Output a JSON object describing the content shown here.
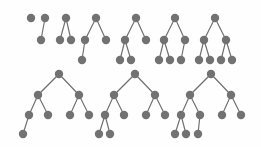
{
  "figure": {
    "title": "",
    "canvas": {
      "width": 261,
      "height": 147
    },
    "background_color": "#fefefe",
    "node_color": "#727272",
    "edge_color": "#6e6e6e",
    "node_radius": 4.2,
    "edge_width": 1.15,
    "rows": 2,
    "tree_count": 10
  },
  "trees": [
    {
      "id": "tree-1",
      "row": 1,
      "index": 1,
      "node_count": 1,
      "depth": 1,
      "nodes": [
        {
          "id": "t1-n1",
          "x": 31,
          "y": 18,
          "level": 0
        }
      ],
      "edges": []
    },
    {
      "id": "tree-2",
      "row": 1,
      "index": 2,
      "node_count": 2,
      "depth": 2,
      "nodes": [
        {
          "id": "t2-n1",
          "x": 45,
          "y": 18,
          "level": 0
        },
        {
          "id": "t2-n2",
          "x": 41,
          "y": 40,
          "level": 1
        }
      ],
      "edges": [
        {
          "from": "t2-n1",
          "to": "t2-n2"
        }
      ]
    },
    {
      "id": "tree-3",
      "row": 1,
      "index": 3,
      "node_count": 3,
      "depth": 2,
      "nodes": [
        {
          "id": "t3-n1",
          "x": 66,
          "y": 18,
          "level": 0
        },
        {
          "id": "t3-n2",
          "x": 60,
          "y": 40,
          "level": 1
        },
        {
          "id": "t3-n3",
          "x": 71,
          "y": 40,
          "level": 1
        }
      ],
      "edges": [
        {
          "from": "t3-n1",
          "to": "t3-n2"
        },
        {
          "from": "t3-n1",
          "to": "t3-n3"
        }
      ]
    },
    {
      "id": "tree-4",
      "row": 1,
      "index": 4,
      "node_count": 4,
      "depth": 3,
      "nodes": [
        {
          "id": "t4-n1",
          "x": 96,
          "y": 18,
          "level": 0
        },
        {
          "id": "t4-n2",
          "x": 85,
          "y": 40,
          "level": 1
        },
        {
          "id": "t4-n3",
          "x": 106,
          "y": 40,
          "level": 1
        },
        {
          "id": "t4-n4",
          "x": 82,
          "y": 60,
          "level": 2
        }
      ],
      "edges": [
        {
          "from": "t4-n1",
          "to": "t4-n2"
        },
        {
          "from": "t4-n1",
          "to": "t4-n3"
        },
        {
          "from": "t4-n2",
          "to": "t4-n4"
        }
      ]
    },
    {
      "id": "tree-5",
      "row": 1,
      "index": 5,
      "node_count": 5,
      "depth": 3,
      "nodes": [
        {
          "id": "t5-n1",
          "x": 136,
          "y": 18,
          "level": 0
        },
        {
          "id": "t5-n2",
          "x": 125,
          "y": 40,
          "level": 1
        },
        {
          "id": "t5-n3",
          "x": 146,
          "y": 40,
          "level": 1
        },
        {
          "id": "t5-n4",
          "x": 120,
          "y": 60,
          "level": 2
        },
        {
          "id": "t5-n5",
          "x": 131,
          "y": 60,
          "level": 2
        }
      ],
      "edges": [
        {
          "from": "t5-n1",
          "to": "t5-n2"
        },
        {
          "from": "t5-n1",
          "to": "t5-n3"
        },
        {
          "from": "t5-n2",
          "to": "t5-n4"
        },
        {
          "from": "t5-n2",
          "to": "t5-n5"
        }
      ]
    },
    {
      "id": "tree-6",
      "row": 1,
      "index": 6,
      "node_count": 6,
      "depth": 3,
      "nodes": [
        {
          "id": "t6-n1",
          "x": 175,
          "y": 18,
          "level": 0
        },
        {
          "id": "t6-n2",
          "x": 164,
          "y": 40,
          "level": 1
        },
        {
          "id": "t6-n3",
          "x": 185,
          "y": 40,
          "level": 1
        },
        {
          "id": "t6-n4",
          "x": 159,
          "y": 60,
          "level": 2
        },
        {
          "id": "t6-n5",
          "x": 170,
          "y": 60,
          "level": 2
        },
        {
          "id": "t6-n6",
          "x": 181,
          "y": 60,
          "level": 2
        }
      ],
      "edges": [
        {
          "from": "t6-n1",
          "to": "t6-n2"
        },
        {
          "from": "t6-n1",
          "to": "t6-n3"
        },
        {
          "from": "t6-n2",
          "to": "t6-n4"
        },
        {
          "from": "t6-n2",
          "to": "t6-n5"
        },
        {
          "from": "t6-n3",
          "to": "t6-n6"
        }
      ]
    },
    {
      "id": "tree-7",
      "row": 1,
      "index": 7,
      "node_count": 7,
      "depth": 3,
      "nodes": [
        {
          "id": "t7-n1",
          "x": 215,
          "y": 18,
          "level": 0
        },
        {
          "id": "t7-n2",
          "x": 204,
          "y": 40,
          "level": 1
        },
        {
          "id": "t7-n3",
          "x": 226,
          "y": 40,
          "level": 1
        },
        {
          "id": "t7-n4",
          "x": 199,
          "y": 60,
          "level": 2
        },
        {
          "id": "t7-n5",
          "x": 210,
          "y": 60,
          "level": 2
        },
        {
          "id": "t7-n6",
          "x": 221,
          "y": 60,
          "level": 2
        },
        {
          "id": "t7-n7",
          "x": 232,
          "y": 60,
          "level": 2
        }
      ],
      "edges": [
        {
          "from": "t7-n1",
          "to": "t7-n2"
        },
        {
          "from": "t7-n1",
          "to": "t7-n3"
        },
        {
          "from": "t7-n2",
          "to": "t7-n4"
        },
        {
          "from": "t7-n2",
          "to": "t7-n5"
        },
        {
          "from": "t7-n3",
          "to": "t7-n6"
        },
        {
          "from": "t7-n3",
          "to": "t7-n7"
        }
      ]
    },
    {
      "id": "tree-8",
      "row": 2,
      "index": 8,
      "node_count": 8,
      "depth": 4,
      "nodes": [
        {
          "id": "t8-n1",
          "x": 59,
          "y": 74,
          "level": 0
        },
        {
          "id": "t8-n2",
          "x": 38,
          "y": 95,
          "level": 1
        },
        {
          "id": "t8-n3",
          "x": 79,
          "y": 95,
          "level": 1
        },
        {
          "id": "t8-n4",
          "x": 29,
          "y": 115,
          "level": 2
        },
        {
          "id": "t8-n5",
          "x": 48,
          "y": 115,
          "level": 2
        },
        {
          "id": "t8-n6",
          "x": 70,
          "y": 115,
          "level": 2
        },
        {
          "id": "t8-n7",
          "x": 89,
          "y": 115,
          "level": 2
        },
        {
          "id": "t8-n8",
          "x": 23,
          "y": 134,
          "level": 3
        }
      ],
      "edges": [
        {
          "from": "t8-n1",
          "to": "t8-n2"
        },
        {
          "from": "t8-n1",
          "to": "t8-n3"
        },
        {
          "from": "t8-n2",
          "to": "t8-n4"
        },
        {
          "from": "t8-n2",
          "to": "t8-n5"
        },
        {
          "from": "t8-n3",
          "to": "t8-n6"
        },
        {
          "from": "t8-n3",
          "to": "t8-n7"
        },
        {
          "from": "t8-n4",
          "to": "t8-n8"
        }
      ]
    },
    {
      "id": "tree-9",
      "row": 2,
      "index": 9,
      "node_count": 9,
      "depth": 4,
      "nodes": [
        {
          "id": "t9-n1",
          "x": 135,
          "y": 74,
          "level": 0
        },
        {
          "id": "t9-n2",
          "x": 114,
          "y": 95,
          "level": 1
        },
        {
          "id": "t9-n3",
          "x": 155,
          "y": 95,
          "level": 1
        },
        {
          "id": "t9-n4",
          "x": 105,
          "y": 115,
          "level": 2
        },
        {
          "id": "t9-n5",
          "x": 124,
          "y": 115,
          "level": 2
        },
        {
          "id": "t9-n6",
          "x": 146,
          "y": 115,
          "level": 2
        },
        {
          "id": "t9-n7",
          "x": 165,
          "y": 115,
          "level": 2
        },
        {
          "id": "t9-n8",
          "x": 99,
          "y": 134,
          "level": 3
        },
        {
          "id": "t9-n9",
          "x": 110,
          "y": 134,
          "level": 3
        }
      ],
      "edges": [
        {
          "from": "t9-n1",
          "to": "t9-n2"
        },
        {
          "from": "t9-n1",
          "to": "t9-n3"
        },
        {
          "from": "t9-n2",
          "to": "t9-n4"
        },
        {
          "from": "t9-n2",
          "to": "t9-n5"
        },
        {
          "from": "t9-n3",
          "to": "t9-n6"
        },
        {
          "from": "t9-n3",
          "to": "t9-n7"
        },
        {
          "from": "t9-n4",
          "to": "t9-n8"
        },
        {
          "from": "t9-n4",
          "to": "t9-n9"
        }
      ]
    },
    {
      "id": "tree-10",
      "row": 2,
      "index": 10,
      "node_count": 10,
      "depth": 4,
      "nodes": [
        {
          "id": "t10-n1",
          "x": 211,
          "y": 74,
          "level": 0
        },
        {
          "id": "t10-n2",
          "x": 190,
          "y": 95,
          "level": 1
        },
        {
          "id": "t10-n3",
          "x": 231,
          "y": 95,
          "level": 1
        },
        {
          "id": "t10-n4",
          "x": 181,
          "y": 115,
          "level": 2
        },
        {
          "id": "t10-n5",
          "x": 200,
          "y": 115,
          "level": 2
        },
        {
          "id": "t10-n6",
          "x": 222,
          "y": 115,
          "level": 2
        },
        {
          "id": "t10-n7",
          "x": 241,
          "y": 115,
          "level": 2
        },
        {
          "id": "t10-n8",
          "x": 175,
          "y": 134,
          "level": 3
        },
        {
          "id": "t10-n9",
          "x": 186,
          "y": 134,
          "level": 3
        },
        {
          "id": "t10-n10",
          "x": 198,
          "y": 134,
          "level": 3
        }
      ],
      "edges": [
        {
          "from": "t10-n1",
          "to": "t10-n2"
        },
        {
          "from": "t10-n1",
          "to": "t10-n3"
        },
        {
          "from": "t10-n2",
          "to": "t10-n4"
        },
        {
          "from": "t10-n2",
          "to": "t10-n5"
        },
        {
          "from": "t10-n3",
          "to": "t10-n6"
        },
        {
          "from": "t10-n3",
          "to": "t10-n7"
        },
        {
          "from": "t10-n4",
          "to": "t10-n8"
        },
        {
          "from": "t10-n4",
          "to": "t10-n9"
        },
        {
          "from": "t10-n5",
          "to": "t10-n10"
        }
      ]
    }
  ]
}
